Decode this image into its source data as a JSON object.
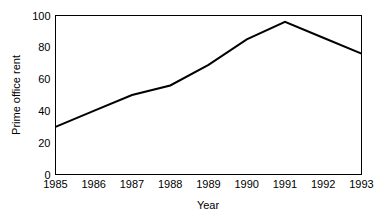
{
  "chart_data": {
    "type": "line",
    "title": "",
    "xlabel": "Year",
    "ylabel": "Prime office rent",
    "x": [
      1985,
      1986,
      1987,
      1988,
      1989,
      1990,
      1991,
      1992,
      1993
    ],
    "categories": [
      "1985",
      "1986",
      "1987",
      "1988",
      "1989",
      "1990",
      "1991",
      "1992",
      "1993"
    ],
    "values": [
      30,
      40,
      50,
      56,
      69,
      85,
      96,
      86,
      76
    ],
    "series": [
      {
        "name": "Prime office rent",
        "values": [
          30,
          40,
          50,
          56,
          69,
          85,
          96,
          86,
          76
        ]
      }
    ],
    "xlim": [
      1985,
      1993
    ],
    "ylim": [
      0,
      100
    ],
    "ytick_labels": [
      "0",
      "20",
      "40",
      "60",
      "80",
      "100"
    ],
    "ytick_values": [
      0,
      20,
      40,
      60,
      80,
      100
    ],
    "xtick_labels": [
      "1985",
      "1986",
      "1987",
      "1988",
      "1989",
      "1990",
      "1991",
      "1992",
      "1993"
    ],
    "grid": false,
    "legend": false,
    "legend_position": "none",
    "line_color": "#000000",
    "background_color": "#ffffff",
    "frame": true
  }
}
